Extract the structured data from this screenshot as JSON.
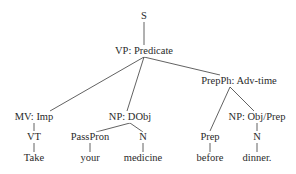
{
  "tree": {
    "root": "S",
    "vp": "VP: Predicate",
    "mv": "MV: Imp",
    "vt": "VT",
    "take": "Take",
    "np_dobj": "NP: DObj",
    "passpron": "PassPron",
    "your": "your",
    "n1": "N",
    "medicine": "medicine",
    "prepph": "PrepPh: Adv-time",
    "prep": "Prep",
    "before": "before",
    "np_objprep": "NP: Obj/Prep",
    "n2": "N",
    "dinner": "dinner."
  },
  "colors": {
    "line": "#3a3a3a",
    "text": "#2a2a2a"
  }
}
